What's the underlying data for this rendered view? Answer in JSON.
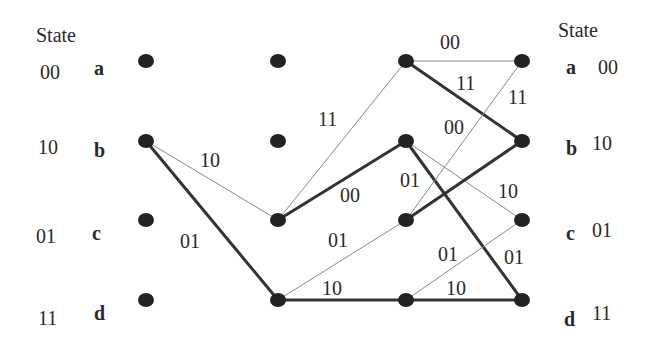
{
  "left_header": "State",
  "right_header": "State",
  "states": [
    {
      "letter": "a",
      "bits": "00"
    },
    {
      "letter": "b",
      "bits": "10"
    },
    {
      "letter": "c",
      "bits": "01"
    },
    {
      "letter": "d",
      "bits": "11"
    }
  ],
  "columns_x": [
    146,
    278,
    406,
    522
  ],
  "rows_y": [
    61,
    141,
    220,
    300
  ],
  "edges": [
    {
      "from": [
        0,
        1
      ],
      "to": [
        1,
        2
      ],
      "label": "10",
      "weight": "thin",
      "lx": 200,
      "ly": 167
    },
    {
      "from": [
        0,
        1
      ],
      "to": [
        1,
        3
      ],
      "label": "01",
      "weight": "thick",
      "lx": 180,
      "ly": 248
    },
    {
      "from": [
        1,
        2
      ],
      "to": [
        2,
        0
      ],
      "label": "11",
      "weight": "thin",
      "lx": 318,
      "ly": 126
    },
    {
      "from": [
        1,
        2
      ],
      "to": [
        2,
        1
      ],
      "label": "00",
      "weight": "thick",
      "lx": 340,
      "ly": 202
    },
    {
      "from": [
        1,
        3
      ],
      "to": [
        2,
        2
      ],
      "label": "01",
      "weight": "thin",
      "lx": 328,
      "ly": 247
    },
    {
      "from": [
        1,
        3
      ],
      "to": [
        2,
        3
      ],
      "label": "10",
      "weight": "thick",
      "lx": 322,
      "ly": 295
    },
    {
      "from": [
        2,
        0
      ],
      "to": [
        3,
        0
      ],
      "label": "00",
      "weight": "thin",
      "lx": 440,
      "ly": 49
    },
    {
      "from": [
        2,
        0
      ],
      "to": [
        3,
        1
      ],
      "label": "11",
      "weight": "thick",
      "lx": 456,
      "ly": 90
    },
    {
      "from": [
        2,
        1
      ],
      "to": [
        3,
        2
      ],
      "label": "10",
      "weight": "thin",
      "lx": 498,
      "ly": 198
    },
    {
      "from": [
        2,
        1
      ],
      "to": [
        3,
        3
      ],
      "label": "01",
      "weight": "thick",
      "lx": 504,
      "ly": 264
    },
    {
      "from": [
        2,
        2
      ],
      "to": [
        3,
        0
      ],
      "label": "11",
      "weight": "thin",
      "lx": 508,
      "ly": 104
    },
    {
      "from": [
        2,
        2
      ],
      "to": [
        3,
        1
      ],
      "label": "00",
      "weight": "thick",
      "lx": 444,
      "ly": 134
    },
    {
      "from": [
        2,
        1
      ],
      "to": [
        3,
        2
      ],
      "label": "",
      "weight": "thin",
      "lx": 0,
      "ly": 0
    },
    {
      "from": [
        2,
        3
      ],
      "to": [
        3,
        2
      ],
      "label": "01",
      "weight": "thin",
      "lx": 438,
      "ly": 261
    },
    {
      "from": [
        2,
        3
      ],
      "to": [
        3,
        3
      ],
      "label": "10",
      "weight": "thick",
      "lx": 446,
      "ly": 295
    }
  ],
  "extra_labels": [
    {
      "text": "01",
      "x": 400,
      "y": 187
    }
  ]
}
